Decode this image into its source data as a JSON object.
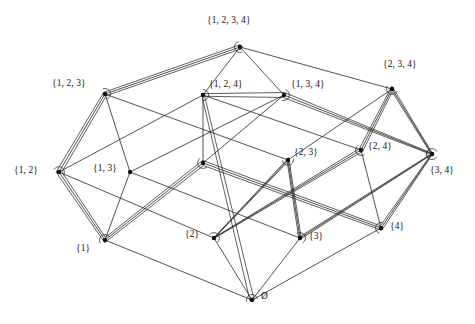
{
  "figure": {
    "caption": "",
    "empty_set_glyph": "Ø",
    "colors": {
      "edge": "#1a1a1a",
      "ribbon": "#2a2a2a",
      "node": "#111111",
      "background": "#ffffff",
      "caption": "#9a9a9a"
    }
  },
  "nodes": [
    {
      "id": "1234",
      "label": "{1, 2, 3, 4}",
      "x": 240,
      "y": 47,
      "rank": 4,
      "label_x": 207,
      "label_y": 22,
      "label_align": "left"
    },
    {
      "id": "123",
      "label": "{1, 2, 3}",
      "x": 105,
      "y": 94,
      "rank": 3,
      "label_x": 52,
      "label_y": 85,
      "label_align": "left"
    },
    {
      "id": "124",
      "label": "{1, 2, 4}",
      "x": 203,
      "y": 95,
      "rank": 3,
      "label_x": 209,
      "label_y": 86,
      "label_align": "left"
    },
    {
      "id": "134",
      "label": "{1, 3, 4}",
      "x": 284,
      "y": 95,
      "rank": 3,
      "label_x": 291,
      "label_y": 86,
      "label_align": "left"
    },
    {
      "id": "234",
      "label": "{2, 3, 4}",
      "x": 392,
      "y": 89,
      "rank": 3,
      "label_x": 383,
      "label_y": 66,
      "label_align": "left"
    },
    {
      "id": "12",
      "label": "{1, 2}",
      "x": 59,
      "y": 172,
      "rank": 2,
      "label_x": 14,
      "label_y": 172,
      "label_align": "left"
    },
    {
      "id": "13",
      "label": "{1, 3}",
      "x": 130,
      "y": 172,
      "rank": 2,
      "label_x": 93,
      "label_y": 170,
      "label_align": "left"
    },
    {
      "id": "14",
      "label": "",
      "x": 203,
      "y": 163,
      "rank": 2,
      "label_x": 0,
      "label_y": 0,
      "label_align": "left"
    },
    {
      "id": "23",
      "label": "{2, 3}",
      "x": 288,
      "y": 160,
      "rank": 2,
      "label_x": 294,
      "label_y": 154,
      "label_align": "left"
    },
    {
      "id": "24",
      "label": "{2, 4}",
      "x": 361,
      "y": 150,
      "rank": 2,
      "label_x": 368,
      "label_y": 148,
      "label_align": "left"
    },
    {
      "id": "34",
      "label": "{3, 4}",
      "x": 432,
      "y": 154,
      "rank": 2,
      "label_x": 430,
      "label_y": 172,
      "label_align": "left"
    },
    {
      "id": "1",
      "label": "{1}",
      "x": 105,
      "y": 240,
      "rank": 1,
      "label_x": 76,
      "label_y": 250,
      "label_align": "left"
    },
    {
      "id": "2",
      "label": "{2}",
      "x": 214,
      "y": 238,
      "rank": 1,
      "label_x": 185,
      "label_y": 236,
      "label_align": "left"
    },
    {
      "id": "3",
      "label": "{3}",
      "x": 300,
      "y": 238,
      "rank": 1,
      "label_x": 309,
      "label_y": 238,
      "label_align": "left"
    },
    {
      "id": "4",
      "label": "{4}",
      "x": 381,
      "y": 228,
      "rank": 1,
      "label_x": 390,
      "label_y": 228,
      "label_align": "left"
    },
    {
      "id": "0",
      "label": "Ø",
      "x": 252,
      "y": 300,
      "rank": 0,
      "label_x": 261,
      "label_y": 298,
      "label_align": "left"
    }
  ],
  "edges": [
    {
      "from": "1234",
      "to": "123"
    },
    {
      "from": "1234",
      "to": "124"
    },
    {
      "from": "1234",
      "to": "134"
    },
    {
      "from": "1234",
      "to": "234"
    },
    {
      "from": "123",
      "to": "12"
    },
    {
      "from": "123",
      "to": "13"
    },
    {
      "from": "123",
      "to": "23"
    },
    {
      "from": "124",
      "to": "12"
    },
    {
      "from": "124",
      "to": "14"
    },
    {
      "from": "124",
      "to": "24"
    },
    {
      "from": "134",
      "to": "13"
    },
    {
      "from": "134",
      "to": "14"
    },
    {
      "from": "134",
      "to": "34"
    },
    {
      "from": "234",
      "to": "23"
    },
    {
      "from": "234",
      "to": "24"
    },
    {
      "from": "234",
      "to": "34"
    },
    {
      "from": "12",
      "to": "1"
    },
    {
      "from": "12",
      "to": "2"
    },
    {
      "from": "13",
      "to": "1"
    },
    {
      "from": "13",
      "to": "3"
    },
    {
      "from": "14",
      "to": "1"
    },
    {
      "from": "14",
      "to": "4"
    },
    {
      "from": "23",
      "to": "2"
    },
    {
      "from": "23",
      "to": "3"
    },
    {
      "from": "24",
      "to": "2"
    },
    {
      "from": "24",
      "to": "4"
    },
    {
      "from": "34",
      "to": "3"
    },
    {
      "from": "34",
      "to": "4"
    },
    {
      "from": "1",
      "to": "0"
    },
    {
      "from": "2",
      "to": "0"
    },
    {
      "from": "3",
      "to": "0"
    },
    {
      "from": "4",
      "to": "0"
    }
  ],
  "highlighted_path": {
    "description": "Hamiltonian path through all 16 subsets drawn as a thick double-lined ribbon",
    "sequence": [
      "1234",
      "123",
      "12",
      "1",
      "14",
      "4",
      "34",
      "3",
      "23",
      "2",
      "24",
      "234",
      "34b",
      "134",
      "124",
      "0"
    ],
    "ribbon_width": 4.2
  }
}
